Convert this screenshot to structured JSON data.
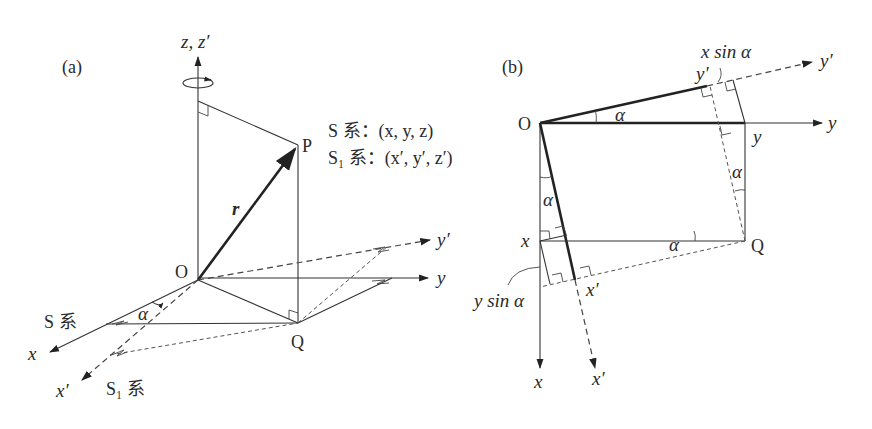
{
  "panel_a": {
    "label": "(a)",
    "axis_z": "z, z′",
    "axis_y": "y",
    "axis_y_prime": "y′",
    "axis_x": "x",
    "axis_x_prime": "x′",
    "origin": "O",
    "point_p": "P",
    "point_q": "Q",
    "vector_r": "r",
    "angle": "α",
    "frame_s": "S 系",
    "frame_s1": "S₁ 系",
    "coords_s": "S 系：(x, y, z)",
    "coords_s1": "S₁ 系：(x′, y′, z′)"
  },
  "panel_b": {
    "label": "(b)",
    "origin": "O",
    "axis_y": "y",
    "axis_y_prime": "y′",
    "axis_x": "x",
    "axis_x_prime": "x′",
    "point_q": "Q",
    "tick_y": "y",
    "tick_x": "x",
    "tick_y_prime": "y′",
    "tick_x_prime": "x′",
    "x_sin_alpha": "x sin α",
    "y_sin_alpha": "y sin α",
    "angle": "α"
  }
}
